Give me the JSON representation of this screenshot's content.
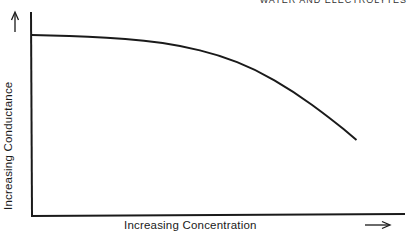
{
  "header": {
    "running_head": "WATER AND ELECTROLYTES"
  },
  "chart_data": {
    "type": "line",
    "title": "",
    "xlabel": "Increasing Concentration",
    "ylabel": "Increasing Conductance",
    "x_arrow": "→",
    "y_arrow": "↑",
    "grid": false,
    "legend": null,
    "ticks": false,
    "series": [
      {
        "name": "Conductance",
        "x": [
          0,
          0.1,
          0.2,
          0.3,
          0.4,
          0.5,
          0.6,
          0.7,
          0.8,
          0.87
        ],
        "y": [
          1.0,
          0.995,
          0.985,
          0.97,
          0.94,
          0.89,
          0.81,
          0.69,
          0.54,
          0.42
        ]
      }
    ],
    "xlim": [
      0,
      1
    ],
    "ylim": [
      0,
      1.05
    ]
  }
}
